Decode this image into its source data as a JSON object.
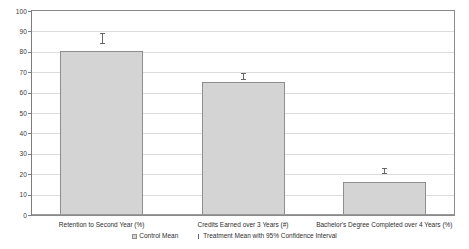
{
  "chart_data": {
    "type": "bar",
    "title": "",
    "subtitle": "",
    "xlabel": "",
    "ylabel": "",
    "ylim": [
      0,
      100
    ],
    "ytick_step": 10,
    "grid": true,
    "legend_position": "bottom",
    "categories": [
      "Retention to Second Year (%)",
      "Credits Earned over 3 Years (#)",
      "Bachelor's Degree Completed over 4 Years (%)"
    ],
    "ytick_labels": [
      "100",
      "90",
      "80",
      "70",
      "60",
      "50",
      "40",
      "30",
      "20",
      "10",
      "0"
    ],
    "series": [
      {
        "name": "Control Mean",
        "values": [
          80.5,
          65.0,
          16.0
        ]
      },
      {
        "name": "Treatment Mean with 95% Confidence Interval",
        "values": [
          86.0,
          67.5,
          21.0
        ],
        "ci_low": [
          84.0,
          66.0,
          20.0
        ],
        "ci_high": [
          88.5,
          69.0,
          22.5
        ]
      }
    ],
    "bar_color": "#d4d4d4",
    "bar_border_color": "#8e8e8e",
    "errorbar_color": "#666666",
    "gridline_color": "#dcdcdc",
    "plot_border_color": "#8a8a8a"
  },
  "legend": {
    "entries": [
      {
        "label": "Control Mean",
        "marker": "filled-square"
      },
      {
        "label": "Treatment Mean with 95% Confidence Interval",
        "marker": "vertical-line"
      }
    ]
  }
}
